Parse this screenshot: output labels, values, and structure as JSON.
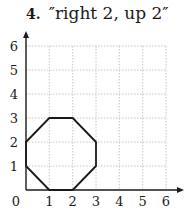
{
  "problem": {
    "number": "4.",
    "instruction": "″right 2, up 2″"
  },
  "grid": {
    "x_ticks": [
      "0",
      "1",
      "2",
      "3",
      "4",
      "5",
      "6"
    ],
    "y_ticks": [
      "1",
      "2",
      "3",
      "4",
      "5",
      "6"
    ],
    "range": [
      0,
      6
    ]
  },
  "shape": {
    "type": "octagon",
    "vertices": [
      [
        1,
        0
      ],
      [
        2,
        0
      ],
      [
        3,
        1
      ],
      [
        3,
        2
      ],
      [
        2,
        3
      ],
      [
        1,
        3
      ],
      [
        0,
        2
      ],
      [
        0,
        1
      ]
    ]
  }
}
